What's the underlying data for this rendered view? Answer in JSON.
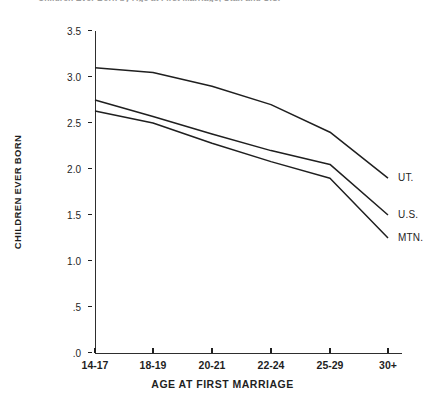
{
  "chart_data": {
    "type": "line",
    "title": "Children Ever Born by Age at First Marriage, Utah and U.S.",
    "xlabel": "AGE AT FIRST MARRIAGE",
    "ylabel": "CHILDREN EVER BORN",
    "categories": [
      "14-17",
      "18-19",
      "20-21",
      "22-24",
      "25-29",
      "30+"
    ],
    "ylim": [
      0.0,
      3.5
    ],
    "ytick_labels": [
      ".0",
      ".5",
      "1.0",
      "1.5",
      "2.0",
      "2.5",
      "3.0",
      "3.5"
    ],
    "ytick_values": [
      0.0,
      0.5,
      1.0,
      1.5,
      2.0,
      2.5,
      3.0,
      3.5
    ],
    "grid": false,
    "legend_position": "right-of-line-ends",
    "series": [
      {
        "name": "UT.",
        "values": [
          3.1,
          3.05,
          2.9,
          2.7,
          2.4,
          1.9
        ]
      },
      {
        "name": "U.S.",
        "values": [
          2.75,
          2.57,
          2.38,
          2.2,
          2.05,
          1.5
        ]
      },
      {
        "name": "MTN.",
        "values": [
          2.63,
          2.5,
          2.28,
          2.08,
          1.9,
          1.25
        ]
      }
    ]
  },
  "axis": {
    "y_title": "CHILDREN EVER BORN",
    "x_title": "AGE AT FIRST MARRIAGE"
  }
}
